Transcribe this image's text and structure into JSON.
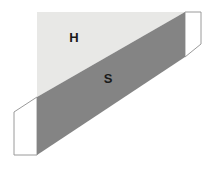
{
  "figure": {
    "canvas": {
      "width": 214,
      "height": 170,
      "background": "#ffffff"
    },
    "colors": {
      "light_region": "#e8e8e6",
      "dark_band": "#848484",
      "flap_fill": "#ffffff",
      "outline": "#9a9a9a",
      "label_text": "#1a1a1a"
    },
    "labels": [
      {
        "id": "label-h",
        "text": "H",
        "x": 74,
        "y": 39,
        "region": "light_region"
      },
      {
        "id": "label-s",
        "text": "S",
        "x": 108,
        "y": 80,
        "region": "dark_band"
      }
    ],
    "shapes": {
      "light_region": {
        "name": "light-upper-region",
        "points": "37,12 184,12 184,14 37,97"
      },
      "light_region_full": {
        "name": "light-upper-region-full",
        "points": "37,12 185,12 37,97"
      },
      "dark_band": {
        "name": "dark-shear-band",
        "points": "37,97 185,12 185,57 37,155"
      },
      "flap_right": {
        "name": "right-flap",
        "points": "185,12 201,12 201,44 185,57"
      },
      "flap_left": {
        "name": "left-flap",
        "points": "14,112 37,97 37,155 14,155"
      }
    }
  }
}
